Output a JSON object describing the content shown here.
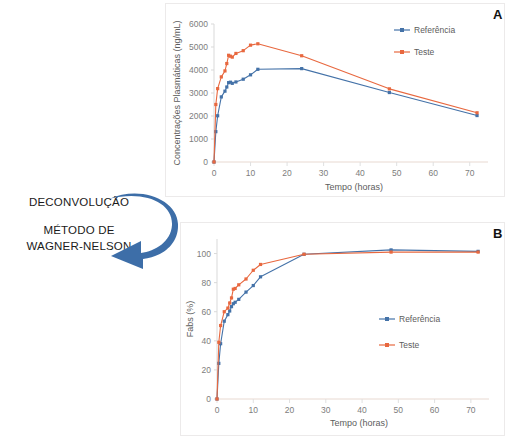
{
  "annotation": {
    "title": "DECONVOLUÇÃO",
    "method_line1": "MÉTODO DE",
    "method_line2": "WAGNER-NELSON",
    "arrow_color": "#3d6ea8"
  },
  "panels": {
    "a_letter": "A",
    "b_letter": "B"
  },
  "colors": {
    "referencia": "#4472a8",
    "teste": "#e8683f",
    "axis": "#d9d9d9",
    "tick_text": "#7d7d7d"
  },
  "chart_data": [
    {
      "id": "panel-a",
      "type": "line",
      "title": "A",
      "xlabel": "Tempo (horas)",
      "ylabel": "Concentrações Plasmáticas (ng/mL)",
      "xlim": [
        0,
        75
      ],
      "ylim": [
        0,
        6000
      ],
      "xticks": [
        0,
        10,
        20,
        30,
        40,
        50,
        60,
        70
      ],
      "yticks": [
        0,
        1000,
        2000,
        3000,
        4000,
        5000,
        6000
      ],
      "grid": false,
      "legend_position": "top-right",
      "series": [
        {
          "name": "Referência",
          "color": "#4472a8",
          "x": [
            0,
            0.5,
            1,
            2,
            3,
            3.5,
            4,
            4.5,
            5,
            6,
            8,
            10,
            12,
            24,
            48,
            72
          ],
          "y": [
            0,
            1320,
            2010,
            2830,
            3080,
            3260,
            3450,
            3470,
            3420,
            3480,
            3600,
            3790,
            4030,
            4060,
            3020,
            2020
          ]
        },
        {
          "name": "Teste",
          "color": "#e8683f",
          "x": [
            0,
            0.5,
            1,
            2,
            3,
            3.5,
            4,
            4.5,
            5,
            6,
            8,
            10,
            12,
            24,
            48,
            72
          ],
          "y": [
            0,
            2500,
            3190,
            3700,
            3960,
            4280,
            4640,
            4600,
            4560,
            4720,
            4840,
            5080,
            5140,
            4620,
            3180,
            2140
          ]
        }
      ]
    },
    {
      "id": "panel-b",
      "type": "line",
      "title": "B",
      "xlabel": "Tempo (horas)",
      "ylabel": "Fabs (%)",
      "xlim": [
        0,
        75
      ],
      "ylim": [
        0,
        110
      ],
      "xticks": [
        0,
        10,
        20,
        30,
        40,
        50,
        60,
        70
      ],
      "yticks": [
        0,
        20,
        40,
        60,
        80,
        100
      ],
      "grid": false,
      "legend_position": "middle-right",
      "series": [
        {
          "name": "Referência",
          "color": "#4472a8",
          "x": [
            0,
            0.5,
            1,
            2,
            3,
            3.5,
            4,
            4.5,
            5,
            6,
            8,
            10,
            12,
            24,
            48,
            72
          ],
          "y": [
            0,
            24.5,
            38,
            53.5,
            58,
            60.5,
            63.5,
            65.5,
            66.5,
            68.5,
            73.5,
            78,
            84,
            99.5,
            102.5,
            101.5
          ]
        },
        {
          "name": "Teste",
          "color": "#e8683f",
          "x": [
            0,
            0.5,
            1,
            2,
            3,
            3.5,
            4,
            4.5,
            5,
            6,
            8,
            10,
            12,
            24,
            48,
            72
          ],
          "y": [
            0,
            39,
            50.5,
            60,
            62.5,
            66,
            69.5,
            75.5,
            76,
            78.5,
            82.5,
            88.5,
            92.5,
            99.5,
            101,
            101
          ]
        }
      ]
    }
  ]
}
